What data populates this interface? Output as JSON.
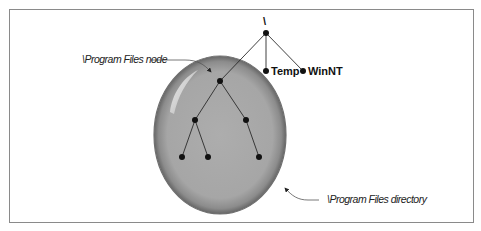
{
  "diagram": {
    "root": {
      "label": "\\",
      "x": 266,
      "y": 33
    },
    "top_children": [
      {
        "label": "Temp",
        "x": 266,
        "y": 71
      },
      {
        "label": "WinNT",
        "x": 303,
        "y": 71
      }
    ],
    "program_files_node": {
      "x": 220,
      "y": 81
    },
    "subtree_level2": [
      {
        "x": 195,
        "y": 120
      },
      {
        "x": 246,
        "y": 120
      }
    ],
    "subtree_level3": [
      {
        "x": 182,
        "y": 157,
        "parent": 0
      },
      {
        "x": 208,
        "y": 157,
        "parent": 0
      },
      {
        "x": 259,
        "y": 157,
        "parent": 1
      }
    ],
    "callouts": {
      "node_label": "\\Program Files node",
      "directory_label": "\\Program Files directory"
    },
    "colors": {
      "ellipse_fill": "#a9a9a9",
      "ellipse_stroke": "#6f6f6f",
      "frame": "#8a8a8a",
      "node": "#111111"
    }
  }
}
